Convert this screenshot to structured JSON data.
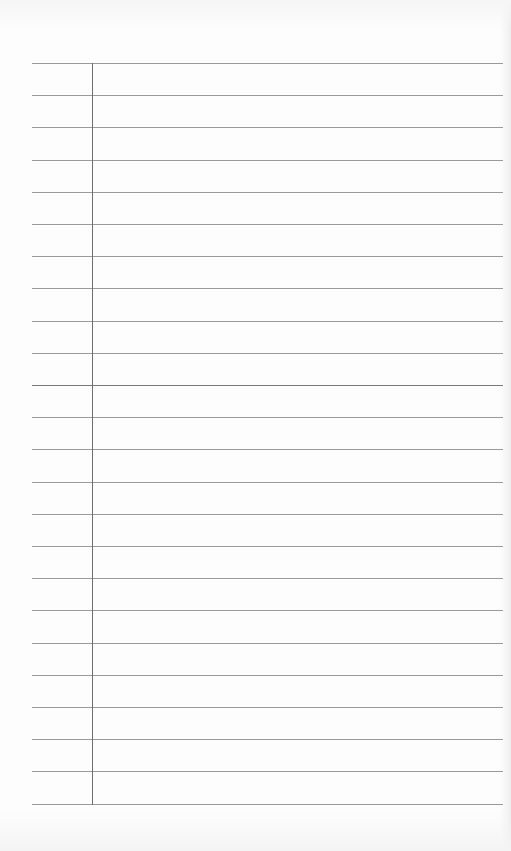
{
  "page": {
    "type": "ruled-notebook-paper",
    "width": 511,
    "height": 851,
    "background_color": "#fdfdfd",
    "line_color": "#9a9a9a",
    "margin_color": "#6e6e6e"
  },
  "rules": {
    "count": 24,
    "first_y": 63,
    "spacing": 32.2,
    "x_start": 32,
    "x_end": 503,
    "emphasized_index": 10
  },
  "margin_line": {
    "x": 92,
    "y_start": 63,
    "y_end": 804
  },
  "content": {
    "text_lines": []
  }
}
